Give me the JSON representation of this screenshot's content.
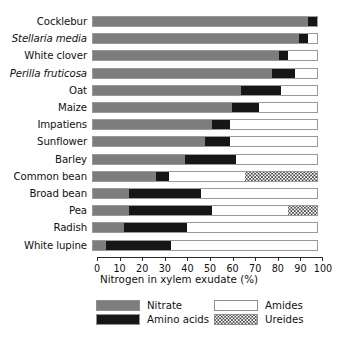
{
  "chart_data": {
    "type": "bar",
    "orientation": "horizontal",
    "stacked": true,
    "title": "",
    "xlabel": "Nitrogen in xylem exudate (%)",
    "ylabel": "",
    "xlim": [
      0,
      100
    ],
    "xticks": [
      0,
      10,
      20,
      30,
      40,
      50,
      60,
      70,
      80,
      90,
      100
    ],
    "xticklabels": [
      "0",
      "10",
      "20",
      "30",
      "40",
      "50",
      "60",
      "70",
      "80",
      "90",
      "100"
    ],
    "grid": false,
    "legend_position": "bottom",
    "categories": [
      "Cocklebur",
      "Stellaria media",
      "White clover",
      "Perilla fruticosa",
      "Oat",
      "Maize",
      "Impatiens",
      "Sunflower",
      "Barley",
      "Common bean",
      "Broad bean",
      "Pea",
      "Radish",
      "White lupine"
    ],
    "category_italic": [
      false,
      true,
      false,
      true,
      false,
      false,
      false,
      false,
      false,
      false,
      false,
      false,
      false,
      false
    ],
    "series": [
      {
        "name": "Nitrate",
        "color": "#7d7d7d",
        "values": [
          96,
          92,
          83,
          80,
          66,
          62,
          53,
          50,
          41,
          28,
          16,
          16,
          14,
          6
        ]
      },
      {
        "name": "Amino acids",
        "color": "#161616",
        "values": [
          4,
          4,
          4,
          10,
          18,
          12,
          8,
          11,
          23,
          6,
          32,
          37,
          28,
          29
        ]
      },
      {
        "name": "Amides",
        "color": "#ffffff",
        "values": [
          0,
          4,
          13,
          10,
          16,
          26,
          39,
          39,
          36,
          34,
          52,
          34,
          58,
          65
        ]
      },
      {
        "name": "Ureides",
        "color": "#4a4a4a",
        "values": [
          0,
          0,
          0,
          0,
          0,
          0,
          0,
          0,
          0,
          32,
          0,
          13,
          0,
          0
        ]
      }
    ]
  },
  "legend": {
    "items": [
      {
        "label": "Nitrate",
        "key": "nitrate"
      },
      {
        "label": "Amides",
        "key": "amides"
      },
      {
        "label": "Amino acids",
        "key": "amino"
      },
      {
        "label": "Ureides",
        "key": "ureides"
      }
    ]
  }
}
